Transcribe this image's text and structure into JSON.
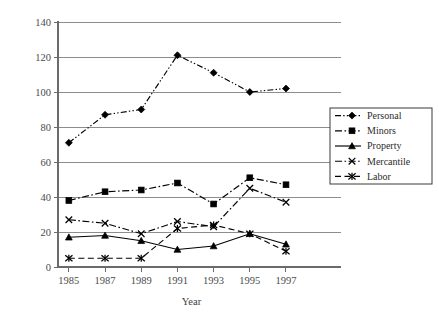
{
  "chart_data": {
    "type": "line",
    "title": "",
    "xlabel": "Year",
    "ylabel": "",
    "x": [
      1985,
      1987,
      1989,
      1991,
      1993,
      1995,
      1997
    ],
    "categories": [
      "1985",
      "1987",
      "1989",
      "1991",
      "1993",
      "1995",
      "1997"
    ],
    "xtick_labels": [
      "1985",
      "1987",
      "1989",
      "1991",
      "1993",
      "1995",
      "1997"
    ],
    "ytick_labels": [
      "0",
      "20",
      "40",
      "60",
      "80",
      "100",
      "120",
      "140"
    ],
    "yticks": [
      0,
      20,
      40,
      60,
      80,
      100,
      120,
      140
    ],
    "ylim": [
      0,
      140
    ],
    "xlim": [
      1984,
      1998
    ],
    "grid": "horizontal",
    "legend_position": "right-middle",
    "series": [
      {
        "name": "Personal",
        "marker": "diamond",
        "linestyle": "dash-dot-dot",
        "color": "#000000",
        "values": [
          71,
          87,
          90,
          121,
          111,
          100,
          102
        ]
      },
      {
        "name": "Minors",
        "marker": "square",
        "linestyle": "dash-dot",
        "color": "#000000",
        "values": [
          38,
          43,
          44,
          48,
          36,
          51,
          47
        ]
      },
      {
        "name": "Property",
        "marker": "triangle",
        "linestyle": "solid",
        "color": "#000000",
        "values": [
          17,
          18,
          15,
          10,
          12,
          19,
          13
        ]
      },
      {
        "name": "Mercantile",
        "marker": "x",
        "linestyle": "dash-dot",
        "color": "#000000",
        "values": [
          27,
          25,
          19,
          26,
          23,
          45,
          37
        ]
      },
      {
        "name": "Labor",
        "marker": "asterisk",
        "linestyle": "dashed",
        "color": "#000000",
        "values": [
          5,
          5,
          5,
          22,
          24,
          19,
          9
        ]
      }
    ]
  },
  "legend": {
    "items": [
      {
        "label": "Personal"
      },
      {
        "label": "Minors"
      },
      {
        "label": "Property"
      },
      {
        "label": "Mercantile"
      },
      {
        "label": "Labor"
      }
    ]
  },
  "axes": {
    "x_title": "Year",
    "y_title": ""
  }
}
